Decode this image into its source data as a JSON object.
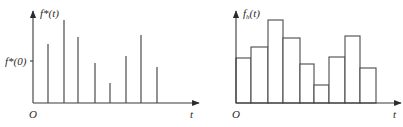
{
  "figure": {
    "left_panel": {
      "y_label": "f*(t)",
      "y_tick_label": "f*(0)",
      "origin_label": "O",
      "x_label": "t",
      "type": "impulse/stem plot (sampled signal)"
    },
    "right_panel": {
      "y_label_main": "f",
      "y_label_sub": "h",
      "y_label_rest": "(t)",
      "origin_label": "O",
      "x_label": "t",
      "type": "staircase (zero-order hold)"
    }
  },
  "chart_data": [
    {
      "type": "bar",
      "title": "f*(t) — sampled impulses",
      "xlabel": "t",
      "ylabel": "f*(t)",
      "categories": [
        "T1",
        "T2",
        "T3",
        "T4",
        "T5",
        "T6",
        "T7",
        "T8"
      ],
      "values": [
        59,
        83,
        66,
        40,
        20,
        47,
        68,
        36
      ],
      "annotation": "f*(0) tick at height ≈ 42",
      "grid": false
    },
    {
      "type": "bar",
      "title": "f_h(t) — hold output",
      "xlabel": "t",
      "ylabel": "f_h(t)",
      "categories": [
        "0",
        "T1",
        "T2",
        "T3",
        "T4",
        "T5",
        "T6",
        "T7",
        "T8"
      ],
      "values": [
        45,
        56,
        83,
        65,
        39,
        18,
        46,
        67,
        35
      ],
      "grid": false
    }
  ]
}
